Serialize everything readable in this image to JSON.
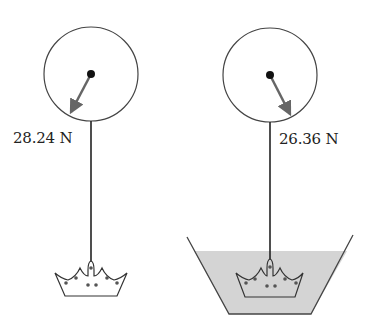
{
  "diagram": {
    "type": "buoyancy-experiment",
    "panels": [
      {
        "id": "in-air",
        "scale_reading": "28.24 N",
        "object": "crown",
        "medium": "air"
      },
      {
        "id": "in-water",
        "scale_reading": "26.36 N",
        "object": "crown",
        "medium": "water"
      }
    ],
    "colors": {
      "line": "#333333",
      "needle": "#666666",
      "water": "#d4d4d4",
      "background": "#ffffff"
    }
  }
}
